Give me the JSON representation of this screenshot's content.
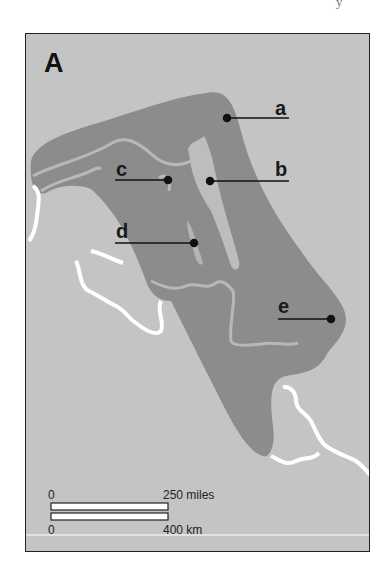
{
  "page_corner_glyph": "y",
  "map": {
    "panel_letter": "A",
    "colors": {
      "background": "#c4c4c4",
      "region_dark": "#8c8c8c",
      "region_light": "#bdbdbd",
      "river_light": "#b8b8b8",
      "coast_white": "#ffffff",
      "frame": "#222222"
    },
    "labels": [
      {
        "id": "a",
        "text": "a"
      },
      {
        "id": "b",
        "text": "b"
      },
      {
        "id": "c",
        "text": "c"
      },
      {
        "id": "d",
        "text": "d"
      },
      {
        "id": "e",
        "text": "e"
      }
    ],
    "scale_bar": {
      "miles_start": "0",
      "miles_end": "250 miles",
      "km_start": "0",
      "km_end": "400 km"
    }
  }
}
